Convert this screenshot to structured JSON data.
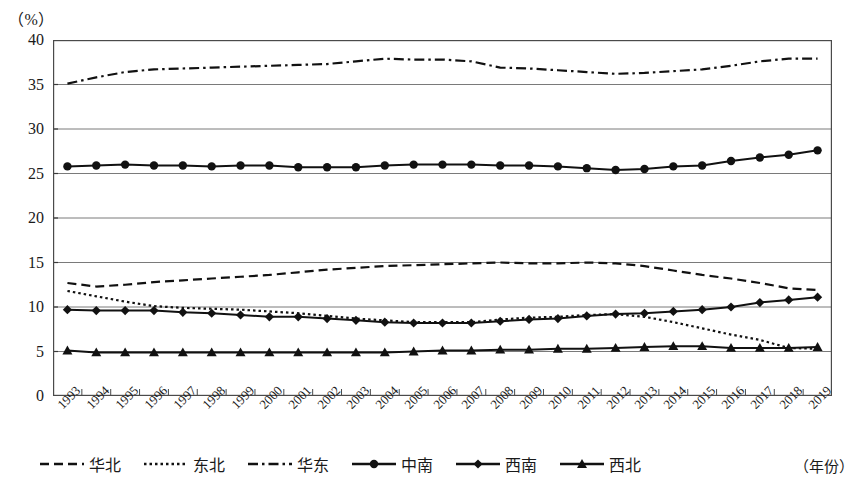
{
  "axis": {
    "unit_label": "（%）",
    "x_axis_name": "（年份）"
  },
  "legend": {
    "items": [
      {
        "label": "华北",
        "style": "dashed",
        "marker": "none"
      },
      {
        "label": "东北",
        "style": "dotted",
        "marker": "none"
      },
      {
        "label": "华东",
        "style": "dashdot",
        "marker": "none"
      },
      {
        "label": "中南",
        "style": "solid",
        "marker": "circle"
      },
      {
        "label": "西南",
        "style": "solid",
        "marker": "diamond"
      },
      {
        "label": "西北",
        "style": "solid",
        "marker": "triangle"
      }
    ]
  },
  "chart_data": {
    "type": "line",
    "title": "",
    "xlabel": "（年份）",
    "ylabel": "（%）",
    "ylim": [
      0,
      40
    ],
    "ytick_step": 5,
    "yticks": [
      "0",
      "5",
      "10",
      "15",
      "20",
      "25",
      "30",
      "35",
      "40"
    ],
    "grid": true,
    "legend_position": "bottom",
    "categories": [
      "1993",
      "1994",
      "1995",
      "1996",
      "1997",
      "1998",
      "1999",
      "2000",
      "2001",
      "2002",
      "2003",
      "2004",
      "2005",
      "2006",
      "2007",
      "2008",
      "2009",
      "2010",
      "2011",
      "2012",
      "2013",
      "2014",
      "2015",
      "2016",
      "2017",
      "2018",
      "2019"
    ],
    "series": [
      {
        "name": "华北",
        "style": "dashed",
        "marker": "none",
        "color": "#111111",
        "values": [
          12.7,
          12.3,
          12.5,
          12.8,
          13.0,
          13.2,
          13.4,
          13.6,
          13.9,
          14.2,
          14.4,
          14.6,
          14.7,
          14.8,
          14.9,
          15.0,
          14.9,
          14.9,
          15.0,
          14.9,
          14.6,
          14.1,
          13.6,
          13.2,
          12.7,
          12.1,
          11.9
        ]
      },
      {
        "name": "东北",
        "style": "dotted",
        "marker": "none",
        "color": "#111111",
        "values": [
          11.8,
          11.2,
          10.6,
          10.1,
          9.9,
          9.8,
          9.7,
          9.5,
          9.3,
          9.0,
          8.7,
          8.5,
          8.3,
          8.3,
          8.3,
          8.6,
          8.8,
          8.9,
          9.1,
          9.2,
          8.9,
          8.3,
          7.6,
          6.9,
          6.3,
          5.4,
          5.3
        ]
      },
      {
        "name": "华东",
        "style": "dashdot",
        "marker": "none",
        "color": "#111111",
        "values": [
          35.1,
          35.8,
          36.4,
          36.7,
          36.8,
          36.9,
          37.0,
          37.1,
          37.2,
          37.3,
          37.6,
          37.9,
          37.8,
          37.8,
          37.6,
          36.9,
          36.8,
          36.6,
          36.4,
          36.2,
          36.3,
          36.5,
          36.7,
          37.1,
          37.6,
          37.9,
          37.9
        ]
      },
      {
        "name": "中南",
        "style": "solid",
        "marker": "circle",
        "color": "#111111",
        "values": [
          25.8,
          25.9,
          26.0,
          25.9,
          25.9,
          25.8,
          25.9,
          25.9,
          25.7,
          25.7,
          25.7,
          25.9,
          26.0,
          26.0,
          26.0,
          25.9,
          25.9,
          25.8,
          25.6,
          25.4,
          25.5,
          25.8,
          25.9,
          26.4,
          26.8,
          27.1,
          27.6
        ]
      },
      {
        "name": "西南",
        "style": "solid",
        "marker": "diamond",
        "color": "#111111",
        "values": [
          9.7,
          9.6,
          9.6,
          9.6,
          9.4,
          9.3,
          9.1,
          8.9,
          8.9,
          8.7,
          8.5,
          8.3,
          8.2,
          8.2,
          8.2,
          8.4,
          8.6,
          8.7,
          9.0,
          9.2,
          9.3,
          9.5,
          9.7,
          10.0,
          10.5,
          10.8,
          11.1
        ]
      },
      {
        "name": "西北",
        "style": "solid",
        "marker": "triangle",
        "color": "#111111",
        "values": [
          5.1,
          4.9,
          4.9,
          4.9,
          4.9,
          4.9,
          4.9,
          4.9,
          4.9,
          4.9,
          4.9,
          4.9,
          5.0,
          5.1,
          5.1,
          5.2,
          5.2,
          5.3,
          5.3,
          5.4,
          5.5,
          5.6,
          5.6,
          5.4,
          5.4,
          5.4,
          5.5
        ]
      }
    ]
  }
}
